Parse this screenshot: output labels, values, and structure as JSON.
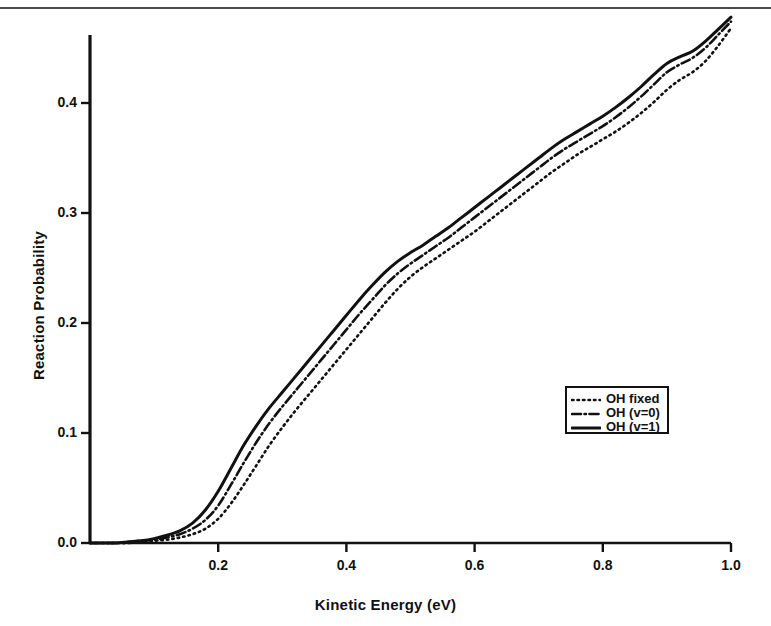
{
  "chart_data": {
    "type": "line",
    "title": "",
    "xlabel": "Kinetic Energy (eV)",
    "ylabel": "Reaction Probability",
    "xlim": [
      0.0,
      1.0
    ],
    "ylim": [
      0.0,
      0.48
    ],
    "grid": false,
    "legend_position": "center-right",
    "xticks": [
      "0.2",
      "0.4",
      "0.6",
      "0.8",
      "1.0"
    ],
    "xtick_values": [
      0.2,
      0.4,
      0.6,
      0.8,
      1.0
    ],
    "yticks": [
      "0.0",
      "0.1",
      "0.2",
      "0.3",
      "0.4"
    ],
    "ytick_values": [
      0.0,
      0.1,
      0.2,
      0.3,
      0.4
    ],
    "x": [
      0.0,
      0.02,
      0.04,
      0.06,
      0.08,
      0.1,
      0.12,
      0.14,
      0.16,
      0.18,
      0.2,
      0.22,
      0.24,
      0.26,
      0.28,
      0.3,
      0.32,
      0.34,
      0.36,
      0.38,
      0.4,
      0.42,
      0.44,
      0.46,
      0.48,
      0.5,
      0.52,
      0.54,
      0.56,
      0.58,
      0.6,
      0.62,
      0.64,
      0.66,
      0.68,
      0.7,
      0.72,
      0.74,
      0.76,
      0.78,
      0.8,
      0.82,
      0.84,
      0.86,
      0.88,
      0.9,
      0.92,
      0.94,
      0.96,
      0.98,
      1.0
    ],
    "series": [
      {
        "name": "OH fixed",
        "style": "dotted",
        "color": "#111111",
        "values": [
          0.0,
          0.0,
          0.0,
          0.0,
          0.001,
          0.002,
          0.003,
          0.005,
          0.008,
          0.013,
          0.022,
          0.036,
          0.053,
          0.071,
          0.089,
          0.105,
          0.12,
          0.134,
          0.148,
          0.162,
          0.176,
          0.19,
          0.204,
          0.218,
          0.231,
          0.242,
          0.251,
          0.259,
          0.267,
          0.275,
          0.283,
          0.292,
          0.301,
          0.31,
          0.319,
          0.328,
          0.337,
          0.345,
          0.353,
          0.36,
          0.367,
          0.374,
          0.382,
          0.391,
          0.401,
          0.412,
          0.421,
          0.428,
          0.438,
          0.452,
          0.468
        ]
      },
      {
        "name": "OH (v=0)",
        "style": "dashdot",
        "color": "#111111",
        "values": [
          0.0,
          0.0,
          0.0,
          0.001,
          0.002,
          0.003,
          0.005,
          0.008,
          0.013,
          0.021,
          0.034,
          0.053,
          0.073,
          0.092,
          0.109,
          0.124,
          0.138,
          0.152,
          0.166,
          0.18,
          0.194,
          0.208,
          0.221,
          0.234,
          0.245,
          0.254,
          0.262,
          0.27,
          0.278,
          0.287,
          0.296,
          0.305,
          0.314,
          0.323,
          0.332,
          0.341,
          0.35,
          0.358,
          0.365,
          0.372,
          0.379,
          0.387,
          0.396,
          0.406,
          0.417,
          0.428,
          0.435,
          0.441,
          0.45,
          0.462,
          0.474
        ]
      },
      {
        "name": "OH (v=1)",
        "style": "solid",
        "color": "#111111",
        "values": [
          0.0,
          0.0,
          0.0,
          0.001,
          0.002,
          0.004,
          0.007,
          0.011,
          0.018,
          0.03,
          0.047,
          0.068,
          0.089,
          0.107,
          0.123,
          0.137,
          0.151,
          0.165,
          0.179,
          0.193,
          0.207,
          0.221,
          0.234,
          0.246,
          0.256,
          0.264,
          0.271,
          0.279,
          0.287,
          0.296,
          0.305,
          0.314,
          0.323,
          0.332,
          0.341,
          0.35,
          0.359,
          0.367,
          0.374,
          0.381,
          0.388,
          0.396,
          0.405,
          0.415,
          0.426,
          0.436,
          0.442,
          0.447,
          0.456,
          0.467,
          0.478
        ]
      }
    ]
  },
  "legend": {
    "items": [
      {
        "label": "OH fixed",
        "style": "dotted"
      },
      {
        "label": "OH (v=0)",
        "style": "dashdot"
      },
      {
        "label": "OH (v=1)",
        "style": "solid"
      }
    ]
  },
  "axes": {
    "x_title": "Kinetic Energy (eV)",
    "y_title": "Reaction Probability"
  }
}
